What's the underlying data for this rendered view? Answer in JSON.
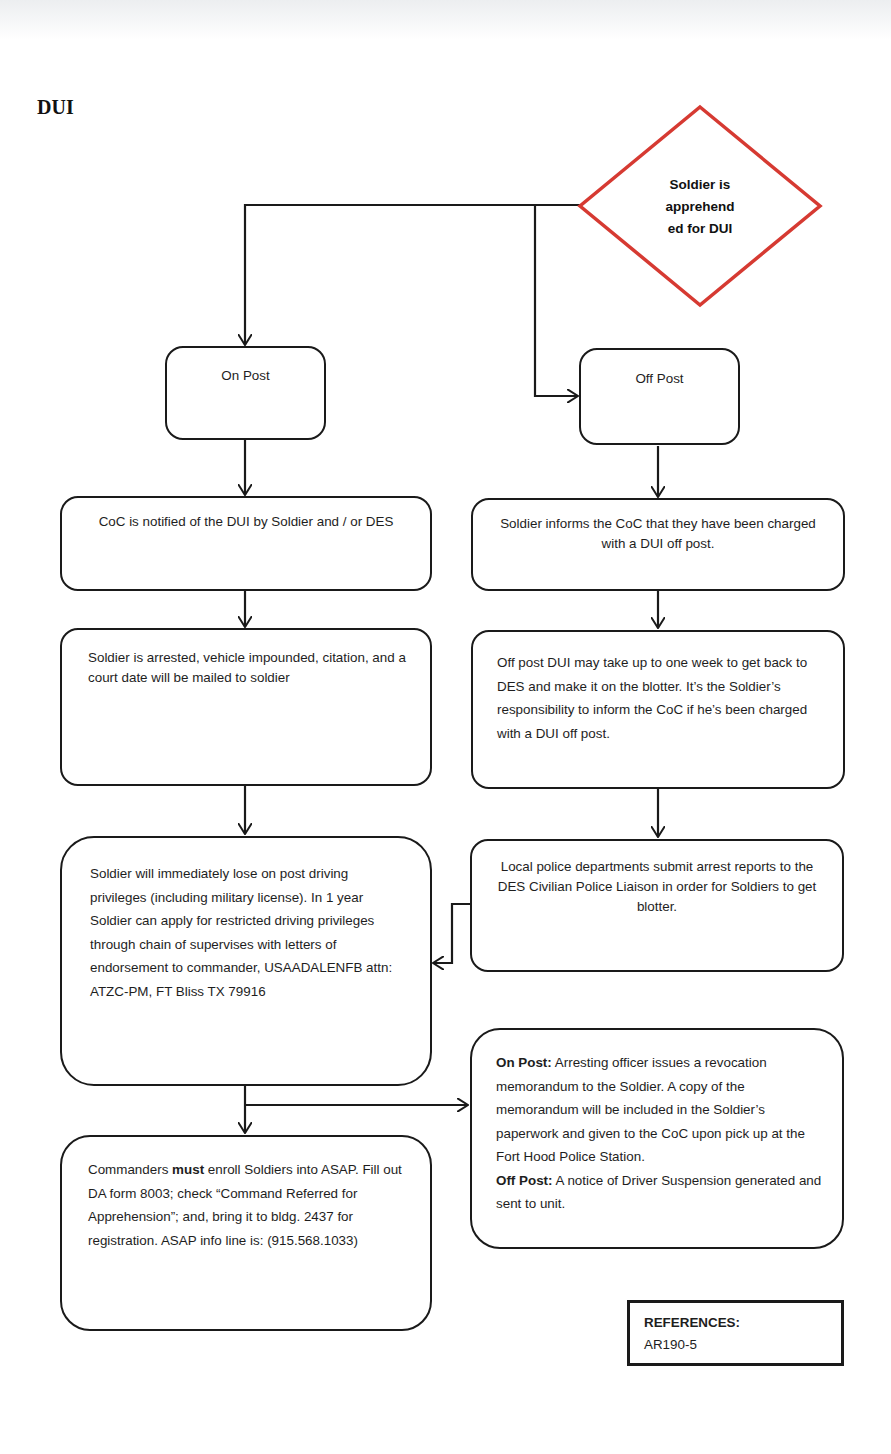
{
  "title": "DUI",
  "colors": {
    "decision_border": "#d63a32",
    "box_border": "#1a1a1a",
    "text": "#1e1e1e",
    "background": "#ffffff"
  },
  "decision": {
    "lines": [
      "Soldier is",
      "apprehend",
      "ed for DUI"
    ]
  },
  "on_post": {
    "branch_label": "On Post",
    "step1": "CoC is notified of the DUI by Soldier and / or DES",
    "step2": "Soldier is arrested, vehicle impounded, citation, and a court date will be mailed to soldier",
    "step3": "Soldier will immediately lose on post driving privileges (including military license).  In 1 year Soldier can apply for restricted driving privileges through chain of supervises with letters of endorsement to commander, USAADALENFB attn: ATZC-PM, FT Bliss TX 79916",
    "step4": {
      "before": "Commanders ",
      "emphasis": "must",
      "after": " enroll Soldiers into ASAP. Fill out DA form 8003; check “Command Referred  for Apprehension”; and, bring it to bldg. 2437 for registration.  ASAP info line is: (915.568.1033)"
    }
  },
  "off_post": {
    "branch_label": "Off Post",
    "step1": "Soldier informs the CoC that they have been charged with a DUI off post.",
    "step2": "Off post DUI may take up to one week to get back to DES and make it on the blotter.  It’s the Soldier’s responsibility to inform the CoC if he’s been charged with a DUI off post.",
    "step3": "Local police departments submit arrest reports to the DES Civilian Police Liaison in order for Soldiers to get blotter."
  },
  "revocation": {
    "on_post_label": "On Post:",
    "on_post_text": "  Arresting officer issues a revocation memorandum to the Soldier.  A copy of the memorandum will be included in the Soldier’s paperwork and given to the CoC  upon pick up at the Fort Hood Police Station.",
    "off_post_label": "Off Post:",
    "off_post_text": "  A notice of Driver Suspension generated and sent to unit."
  },
  "references": {
    "heading": "REFERENCES:",
    "items": [
      "AR190-5"
    ]
  }
}
